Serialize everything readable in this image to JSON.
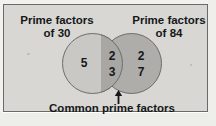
{
  "diagram": {
    "type": "venn",
    "title_left": "Prime factors\nof 30",
    "title_left_line1": "Prime factors",
    "title_left_line2": "of 30",
    "title_right_line1": "Prime factors",
    "title_right_line2": "of 84",
    "caption": "Common prime factors",
    "sets": [
      {
        "name": "Prime factors of 30",
        "side": "left",
        "exclusive_values": [
          "5"
        ],
        "fill_color": "#c9c8c4"
      },
      {
        "name": "Prime factors of 84",
        "side": "right",
        "exclusive_values": [
          "2",
          "7"
        ],
        "fill_color": "#aeadaa"
      }
    ],
    "intersection": {
      "label": "Common prime factors",
      "values": [
        "2",
        "3"
      ],
      "fill_color": "#a8a7a3"
    },
    "left_values": {
      "v1": "5"
    },
    "intersection_values": {
      "v1": "2",
      "v2": "3"
    },
    "right_values": {
      "v1": "2",
      "v2": "7"
    },
    "colors": {
      "background": "#d8d7d3",
      "border": "#6a6a68",
      "text": "#16171a",
      "circle_stroke": "#6d6d6b"
    }
  }
}
